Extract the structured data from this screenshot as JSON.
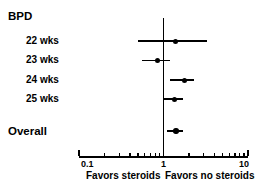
{
  "chart_data": {
    "type": "scatter",
    "subtype": "forest-plot",
    "title": "",
    "xlabel": "",
    "ylabel": "",
    "xscale": "log",
    "xlim": [
      0.1,
      10
    ],
    "grid": false,
    "null_value": 1,
    "legend": "none",
    "axis_ticks": {
      "major": [
        0.1,
        1,
        10
      ],
      "major_labels": [
        "0.1",
        "1",
        "10"
      ],
      "minor": [
        0.2,
        0.3,
        0.4,
        0.5,
        0.6,
        0.7,
        0.8,
        0.9,
        2,
        3,
        4,
        5,
        6,
        7,
        8,
        9
      ]
    },
    "annotations": {
      "left_caption": "Favors steroids",
      "right_caption": "Favors no steroids"
    },
    "group_header": "BPD",
    "summary_label": "Overall",
    "rows": [
      {
        "label": "BPD",
        "kind": "header",
        "estimate": null,
        "ci_low": null,
        "ci_high": null
      },
      {
        "label": "22 wks",
        "kind": "study",
        "estimate": 1.4,
        "ci_low": 0.5,
        "ci_high": 3.3
      },
      {
        "label": "23 wks",
        "kind": "study",
        "estimate": 0.85,
        "ci_low": 0.55,
        "ci_high": 1.2
      },
      {
        "label": "24 wks",
        "kind": "study",
        "estimate": 1.75,
        "ci_low": 1.2,
        "ci_high": 2.3
      },
      {
        "label": "25 wks",
        "kind": "study",
        "estimate": 1.35,
        "ci_low": 1.0,
        "ci_high": 1.7
      },
      {
        "label": "Overall",
        "kind": "summary",
        "estimate": 1.4,
        "ci_low": 1.1,
        "ci_high": 1.7
      }
    ]
  },
  "labels": {
    "group_header": "BPD",
    "row_22": "22 wks",
    "row_23": "23 wks",
    "row_24": "24 wks",
    "row_25": "25 wks",
    "row_overall": "Overall"
  },
  "axis": {
    "tick_low": "0.1",
    "tick_mid": "1",
    "tick_high": "10",
    "caption_left": "Favors steroids",
    "caption_right": "Favors no steroids"
  },
  "colors": {
    "ink": "#000000",
    "background": "#ffffff"
  }
}
